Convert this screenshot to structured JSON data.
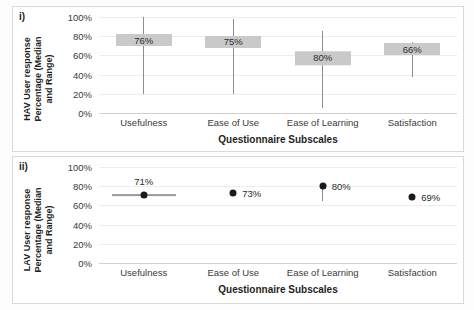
{
  "figure": {
    "background": "#ffffff",
    "box_color": "#c9c9c9",
    "whisker_color": "#8d8d8d",
    "dot_color": "#1a1a1a",
    "grid_color": "#ededed"
  },
  "panels": [
    {
      "tag": "i)",
      "ytitle_line1": "HAV User response",
      "ytitle_line2": "Percentage (Median",
      "ytitle_line3": "and Range)",
      "xtitle": "Questionnaire Subscales"
    },
    {
      "tag": "ii)",
      "ytitle_line1": "LAV User response",
      "ytitle_line2": "Percentage (Median",
      "ytitle_line3": "and Range)",
      "xtitle": "Questionnaire Subscales"
    }
  ],
  "yticks": [
    "100%",
    "80%",
    "60%",
    "40%",
    "20%",
    "0%"
  ],
  "chart_data": [
    {
      "type": "bar",
      "title": "i) HAV User response",
      "xlabel": "Questionnaire Subscales",
      "ylabel": "HAV User response Percentage (Median and Range)",
      "ylim": [
        0,
        100
      ],
      "grid": true,
      "legend": "none",
      "categories": [
        "Usefulness",
        "Ease of Use",
        "Ease of Learning",
        "Satisfaction"
      ],
      "median_values": [
        76,
        75,
        80,
        66
      ],
      "median_labels": [
        "76%",
        "75%",
        "80%",
        "66%"
      ],
      "range_low": [
        20,
        20,
        5,
        38
      ],
      "range_high": [
        100,
        98,
        85,
        74
      ],
      "box_low": [
        71,
        69,
        50,
        62
      ],
      "box_high": [
        81,
        79,
        64,
        71
      ]
    },
    {
      "type": "scatter",
      "title": "ii) LAV User response",
      "xlabel": "Questionnaire Subscales",
      "ylabel": "LAV User response Percentage (Median and Range)",
      "ylim": [
        0,
        100
      ],
      "grid": true,
      "legend": "none",
      "categories": [
        "Usefulness",
        "Ease of Use",
        "Ease of Learning",
        "Satisfaction"
      ],
      "median_values": [
        71,
        73,
        80,
        69
      ],
      "median_labels": [
        "71%",
        "73%",
        "80%",
        "69%"
      ],
      "range_low": [
        71,
        73,
        65,
        69
      ],
      "range_high": [
        71,
        73,
        80,
        69
      ],
      "horizontal_range": [
        true,
        false,
        false,
        false
      ]
    }
  ]
}
